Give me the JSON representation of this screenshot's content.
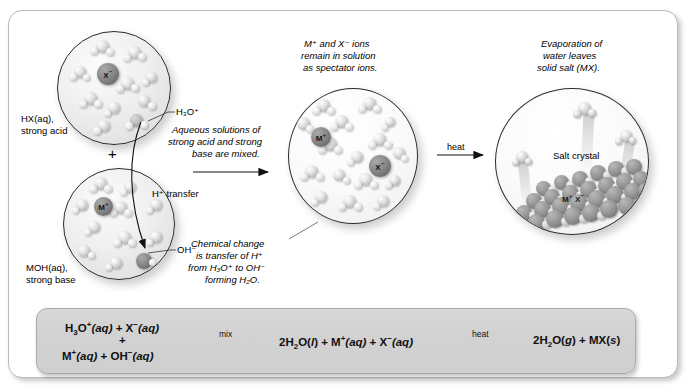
{
  "labels": {
    "hx": "HX(aq),",
    "hx2": "strong acid",
    "plus": "+",
    "moh": "MOH(aq),",
    "moh2": "strong base",
    "h3o": "H₃O⁺",
    "oh": "OH⁻",
    "h_transfer": "H⁺ transfer",
    "mix_note_1": "Aqueous solutions of",
    "mix_note_2": "strong acid and strong",
    "mix_note_3": "base are mixed.",
    "spectator_1": "M⁺ and X⁻ ions",
    "spectator_2": "remain in solution",
    "spectator_3": "as spectator ions.",
    "chem_1": "Chemical change",
    "chem_2": "is transfer of H⁺",
    "chem_3": "from H₃O⁺ to OH⁻",
    "chem_4": "forming H₂O.",
    "evap_1": "Evaporation of",
    "evap_2": "water leaves",
    "evap_3": "solid salt (MX).",
    "salt_crystal": "Salt crystal",
    "heat": "heat",
    "ion_x": "X",
    "ion_x_charge": "−",
    "ion_m": "M",
    "ion_m_charge": "+"
  },
  "equation": {
    "left_line1_a": "H",
    "left_line1_sub": "3",
    "left_line1_b": "O",
    "left_line1_sup": "+",
    "left_line1_aq": "(aq)",
    "left_line1_plus": " + X",
    "left_line1_sup2": "−",
    "left_line1_aq2": "(aq)",
    "left_plus": "+",
    "left_line2_a": "M",
    "left_line2_sup": "+",
    "left_line2_aq": "(aq)",
    "left_line2_plus": " + OH",
    "left_line2_sup2": "−",
    "left_line2_aq2": "(aq)",
    "arrow1_label": "mix",
    "middle_a": "2H",
    "middle_sub": "2",
    "middle_b": "O(",
    "middle_state": "l",
    "middle_c": ") + M",
    "middle_sup": "+",
    "middle_aq": "(aq)",
    "middle_d": " + X",
    "middle_sup2": "−",
    "middle_aq2": "(aq)",
    "arrow2_label": "heat",
    "right_a": "2H",
    "right_sub": "2",
    "right_b": "O(",
    "right_state": "g",
    "right_c": ") + MX(",
    "right_state2": "s",
    "right_d": ")"
  },
  "colors": {
    "frame_border": "#b9b9b9",
    "circle_border": "#2b2b2b",
    "equation_box": "#d4d4d4",
    "ion_dark": "#6f6f6f",
    "crystal": "#8c8c8c",
    "text": "#000000"
  }
}
